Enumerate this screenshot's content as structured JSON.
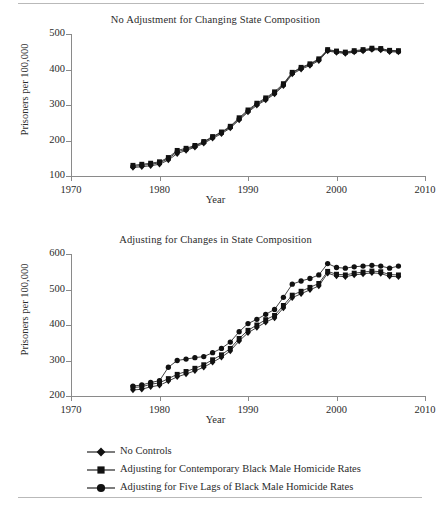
{
  "figure": {
    "ylabel": "Prisoners per 100,000",
    "xlabel": "Year",
    "panel1_title": "No Adjustment for Changing State Composition",
    "panel2_title": "Adjusting for Changes in State Composition"
  },
  "legend": {
    "items": [
      {
        "label": "No Controls",
        "marker": "diamond-marker",
        "color": "#111111"
      },
      {
        "label": "Adjusting for Contemporary Black Male Homicide Rates",
        "marker": "square-marker",
        "color": "#111111"
      },
      {
        "label": "Adjusting for Five Lags of Black Male Homicide Rates",
        "marker": "circle-marker",
        "color": "#111111"
      }
    ]
  },
  "chart_data": [
    {
      "type": "line",
      "title": "No Adjustment for Changing State Composition",
      "xlabel": "Year",
      "ylabel": "Prisoners per 100,000",
      "xlim": [
        1970,
        2010
      ],
      "ylim": [
        100,
        500
      ],
      "xticks": [
        1970,
        1980,
        1990,
        2000,
        2010
      ],
      "yticks": [
        100,
        200,
        300,
        400,
        500
      ],
      "grid": false,
      "legend_position": "below-figure",
      "x": [
        1977,
        1978,
        1979,
        1980,
        1981,
        1982,
        1983,
        1984,
        1985,
        1986,
        1987,
        1988,
        1989,
        1990,
        1991,
        1992,
        1993,
        1994,
        1995,
        1996,
        1997,
        1998,
        1999,
        2000,
        2001,
        2002,
        2003,
        2004,
        2005,
        2006,
        2007
      ],
      "series": [
        {
          "name": "No Controls",
          "marker": "diamond",
          "values": [
            124,
            126,
            129,
            133,
            145,
            163,
            172,
            181,
            192,
            206,
            219,
            235,
            258,
            280,
            299,
            314,
            331,
            354,
            387,
            401,
            411,
            425,
            452,
            448,
            445,
            449,
            452,
            456,
            455,
            450,
            449
          ]
        },
        {
          "name": "Adjusting for Contemporary Black Male Homicide Rates",
          "marker": "square",
          "values": [
            130,
            133,
            136,
            140,
            152,
            172,
            178,
            186,
            197,
            211,
            224,
            240,
            264,
            286,
            305,
            320,
            337,
            360,
            392,
            406,
            416,
            430,
            456,
            452,
            449,
            453,
            456,
            460,
            459,
            454,
            453
          ]
        },
        {
          "name": "Adjusting for Five Lags of Black Male Homicide Rates",
          "marker": "circle",
          "values": [
            127,
            130,
            133,
            137,
            149,
            168,
            175,
            184,
            195,
            209,
            222,
            238,
            261,
            283,
            302,
            317,
            334,
            357,
            390,
            404,
            414,
            428,
            454,
            450,
            447,
            451,
            454,
            458,
            457,
            452,
            451
          ]
        }
      ]
    },
    {
      "type": "line",
      "title": "Adjusting for Changes in State Composition",
      "xlabel": "Year",
      "ylabel": "Prisoners per 100,000",
      "xlim": [
        1970,
        2010
      ],
      "ylim": [
        200,
        600
      ],
      "xticks": [
        1970,
        1980,
        1990,
        2000,
        2010
      ],
      "yticks": [
        200,
        300,
        400,
        500,
        600
      ],
      "grid": false,
      "legend_position": "below-figure",
      "x": [
        1977,
        1978,
        1979,
        1980,
        1981,
        1982,
        1983,
        1984,
        1985,
        1986,
        1987,
        1988,
        1989,
        1990,
        1991,
        1992,
        1993,
        1994,
        1995,
        1996,
        1997,
        1998,
        1999,
        2000,
        2001,
        2002,
        2003,
        2004,
        2005,
        2006,
        2007
      ],
      "series": [
        {
          "name": "No Controls",
          "marker": "diamond",
          "values": [
            217,
            219,
            226,
            230,
            242,
            254,
            262,
            271,
            281,
            295,
            309,
            327,
            355,
            378,
            393,
            408,
            420,
            448,
            477,
            488,
            499,
            510,
            546,
            538,
            536,
            541,
            544,
            547,
            545,
            537,
            536
          ]
        },
        {
          "name": "Adjusting for Contemporary Black Male Homicide Rates",
          "marker": "square",
          "values": [
            224,
            226,
            233,
            237,
            249,
            261,
            269,
            278,
            288,
            302,
            316,
            334,
            362,
            385,
            400,
            415,
            427,
            455,
            484,
            495,
            506,
            517,
            551,
            543,
            541,
            546,
            549,
            552,
            550,
            542,
            541
          ]
        },
        {
          "name": "Adjusting for Five Lags of Black Male Homicide Rates",
          "marker": "circle",
          "values": [
            228,
            231,
            238,
            243,
            281,
            300,
            304,
            308,
            311,
            322,
            334,
            352,
            381,
            404,
            416,
            430,
            444,
            478,
            515,
            524,
            531,
            541,
            573,
            562,
            560,
            564,
            566,
            568,
            566,
            560,
            566
          ]
        }
      ]
    }
  ]
}
